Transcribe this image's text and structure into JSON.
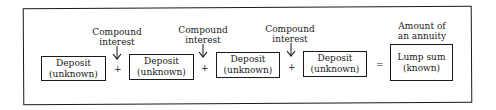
{
  "diagram": {
    "deposits": [
      {
        "line1": "Deposit",
        "line2": "(unknown)"
      },
      {
        "line1": "Deposit",
        "line2": "(unknown)"
      },
      {
        "line1": "Deposit",
        "line2": "(unknown)"
      },
      {
        "line1": "Deposit",
        "line2": "(unknown)"
      }
    ],
    "compound_labels": [
      {
        "line1": "Compound",
        "line2": "interest"
      },
      {
        "line1": "Compound",
        "line2": "interest"
      },
      {
        "line1": "Compound",
        "line2": "interest"
      }
    ],
    "operators": {
      "plus": "+",
      "equals": "="
    },
    "result": {
      "caption1": "Amount of",
      "caption2": "an annuity",
      "line1": "Lump sum",
      "line2": "(known)"
    }
  }
}
